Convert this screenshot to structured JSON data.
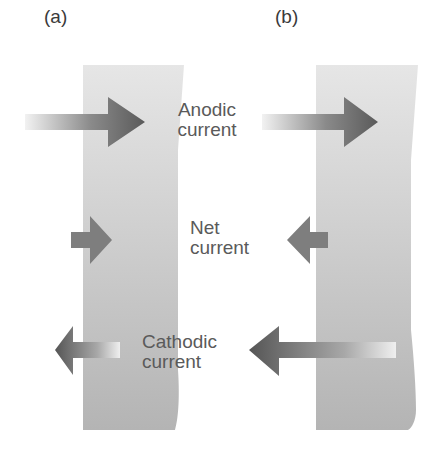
{
  "panels": [
    {
      "label": "(a)",
      "id": "a"
    },
    {
      "label": "(b)",
      "id": "b"
    }
  ],
  "captions": {
    "anodic": {
      "line1": "Anodic",
      "line2": "current"
    },
    "net": {
      "line1": "Net",
      "line2": "current"
    },
    "cathodic": {
      "line1": "Cathodic",
      "line2": "current"
    }
  },
  "colors": {
    "slab_top": "#e4e4e4",
    "slab_bottom": "#b4b4b4",
    "arrow_dark": "#5c5c5c",
    "arrow_mid": "#7a7a7a",
    "arrow_light": "#e8e8e8",
    "text": "#5a5a5a"
  }
}
